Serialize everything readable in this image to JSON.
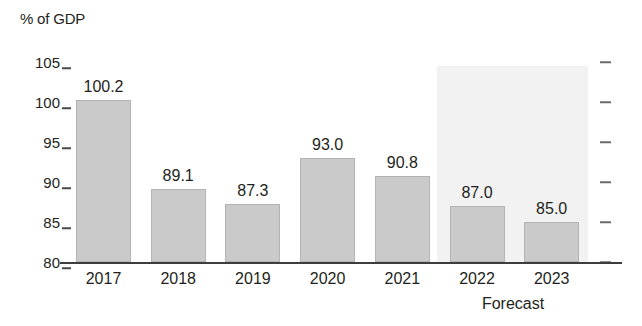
{
  "chart_data": {
    "type": "bar",
    "title": "",
    "ylabel": "% of GDP",
    "xlabel": "",
    "categories": [
      "2017",
      "2018",
      "2019",
      "2020",
      "2021",
      "2022",
      "2023"
    ],
    "values": [
      100.2,
      89.1,
      87.3,
      93.0,
      90.8,
      87.0,
      85.0
    ],
    "value_labels": [
      "100.2",
      "89.1",
      "87.3",
      "93.0",
      "90.8",
      "87.0",
      "85.0"
    ],
    "ylim": [
      80,
      105
    ],
    "yticks": [
      80,
      85,
      90,
      95,
      100,
      105
    ],
    "ytick_labels": [
      "80",
      "85",
      "90",
      "95",
      "100",
      "105"
    ],
    "grid": false,
    "legend": null,
    "annotations": [
      {
        "text": "Forecast",
        "covers": [
          "2022",
          "2023"
        ]
      }
    ],
    "series": [
      {
        "name": "Government debt",
        "values": [
          100.2,
          89.1,
          87.3,
          93.0,
          90.8,
          87.0,
          85.0
        ]
      }
    ],
    "colors": {
      "bar_fill": "#cacaca",
      "bar_stroke": "#b3b3b3",
      "forecast_band": "#f2f2f2",
      "axis": "#3d3d3d",
      "text": "#231f20",
      "background": "#ffffff"
    }
  },
  "axis": {
    "unit_title": "% of GDP",
    "forecast_note": "Forecast"
  }
}
